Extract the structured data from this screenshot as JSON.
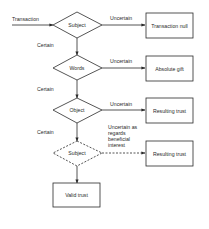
{
  "diagram": {
    "type": "flowchart",
    "colors": {
      "stroke": "#2a2a2a",
      "background": "#ffffff",
      "text": "#2a2a2a"
    },
    "entry_label": "Transaction",
    "decisions": [
      {
        "id": "subject",
        "label": "Subject",
        "style": "solid"
      },
      {
        "id": "words",
        "label": "Words",
        "style": "solid"
      },
      {
        "id": "object",
        "label": "Object",
        "style": "solid"
      },
      {
        "id": "subject2",
        "label": "Subject",
        "style": "dashed"
      }
    ],
    "outcomes": [
      {
        "id": "transaction-null",
        "label": "Transaction null"
      },
      {
        "id": "absolute-gift",
        "label": "Absolute gift"
      },
      {
        "id": "resulting-trust-1",
        "label": "Resulting trust"
      },
      {
        "id": "resulting-trust-2",
        "label": "Resulting trust"
      },
      {
        "id": "valid-trust",
        "label": "Valid trust"
      }
    ],
    "edge_labels": {
      "uncertain": "Uncertain",
      "certain": "Certain",
      "uncertain_beneficial": [
        "Uncertain as",
        "regards",
        "beneficial",
        "interest"
      ]
    }
  }
}
